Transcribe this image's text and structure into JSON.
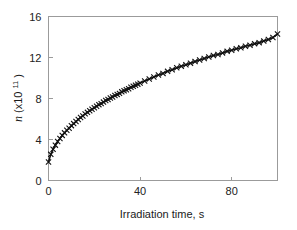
{
  "chart_data": {
    "type": "scatter",
    "title": "",
    "subtitle": "",
    "xlabel": "Irradiation time, s",
    "ylabel": "n  (x10",
    "ylabel_exponent": "11",
    "ylabel_suffix": ")",
    "ylabel_full": "n (x10^11)",
    "xlim": [
      0,
      100
    ],
    "ylim": [
      0,
      16
    ],
    "xticks": [
      0,
      40,
      80
    ],
    "xticklabels": [
      "0",
      "40",
      "80"
    ],
    "yticks": [
      0,
      4,
      8,
      12,
      16
    ],
    "yticklabels": [
      "0",
      "4",
      "8",
      "12",
      "16"
    ],
    "grid": false,
    "legend": false,
    "legend_position": "none",
    "marker": "cross",
    "marker_color": "#111111",
    "line_color": "#111111",
    "background_color": "#ffffff",
    "frame_color": "#9b9b9b",
    "series": [
      {
        "name": "n",
        "x": [
          0,
          1,
          2,
          3,
          4,
          5,
          6,
          7,
          8,
          9,
          10,
          11,
          12,
          13,
          14,
          15,
          16,
          17,
          18,
          19,
          20,
          21,
          22,
          23,
          24,
          25,
          26,
          27,
          28,
          29,
          30,
          31,
          32,
          33,
          34,
          35,
          36,
          37,
          38,
          39,
          40,
          42,
          44,
          46,
          48,
          50,
          52,
          54,
          56,
          58,
          60,
          62,
          64,
          66,
          68,
          70,
          72,
          74,
          76,
          78,
          80,
          82,
          84,
          86,
          88,
          90,
          92,
          94,
          96,
          98,
          100
        ],
        "y": [
          1.8,
          2.55,
          3.05,
          3.45,
          3.8,
          4.1,
          4.4,
          4.65,
          4.9,
          5.1,
          5.35,
          5.55,
          5.75,
          5.95,
          6.15,
          6.3,
          6.5,
          6.65,
          6.8,
          6.95,
          7.1,
          7.25,
          7.4,
          7.5,
          7.65,
          7.8,
          7.9,
          8.05,
          8.15,
          8.3,
          8.4,
          8.5,
          8.65,
          8.75,
          8.85,
          8.95,
          9.1,
          9.2,
          9.3,
          9.4,
          9.5,
          9.7,
          9.9,
          10.1,
          10.3,
          10.45,
          10.65,
          10.8,
          11.0,
          11.15,
          11.3,
          11.45,
          11.6,
          11.75,
          11.9,
          12.05,
          12.2,
          12.3,
          12.45,
          12.6,
          12.7,
          12.85,
          12.95,
          13.1,
          13.2,
          13.35,
          13.45,
          13.6,
          13.75,
          13.95,
          14.3
        ]
      }
    ]
  }
}
